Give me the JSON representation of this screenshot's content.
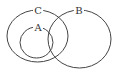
{
  "diagram": {
    "type": "venn",
    "sets": [
      {
        "id": "C",
        "label": "C",
        "cx": 37.5,
        "cy": 36,
        "rx": 30.5,
        "ry": 26,
        "label_x": 38,
        "label_y": 10
      },
      {
        "id": "B",
        "label": "B",
        "cx": 79.5,
        "cy": 39,
        "rx": 31.5,
        "ry": 29,
        "label_x": 79,
        "label_y": 10
      },
      {
        "id": "A",
        "label": "A",
        "cx": 36.5,
        "cy": 42.5,
        "rx": 16.5,
        "ry": 15.5,
        "label_x": 38,
        "label_y": 27
      }
    ],
    "relations": [
      "A ⊂ C",
      "A ∩ B ≠ ∅",
      "B ∩ C ≠ ∅"
    ],
    "stroke_color": "#444444"
  }
}
